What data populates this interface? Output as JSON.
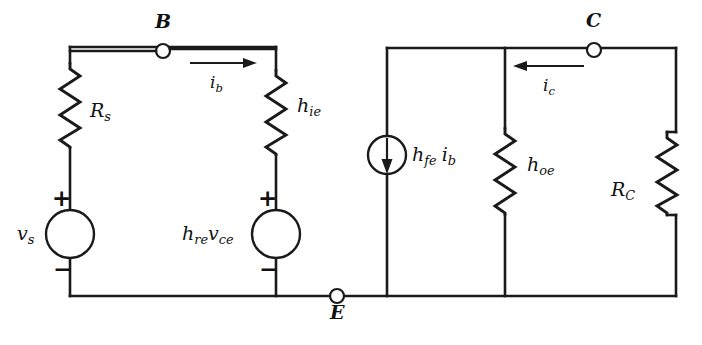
{
  "figure": {
    "type": "circuit-diagram",
    "background_color": "#ffffff",
    "line_color": "#1a1a1a",
    "width": 702,
    "height": 345
  },
  "nodes": [
    {
      "id": "B",
      "label": "B",
      "x": 163,
      "y": 51,
      "label_x": 155,
      "label_y": 15
    },
    {
      "id": "E",
      "label": "E",
      "x": 337,
      "y": 296,
      "label_x": 330,
      "label_y": 305
    },
    {
      "id": "C",
      "label": "C",
      "x": 594,
      "y": 50,
      "label_x": 586,
      "label_y": 14
    }
  ],
  "resistors": [
    {
      "id": "Rs",
      "base": "R",
      "sub": "s",
      "label": "R_s",
      "x": 70,
      "y_top": 63,
      "y_bottom": 148,
      "label_x": 90,
      "label_y": 100
    },
    {
      "id": "hie",
      "base": "h",
      "sub": "ie",
      "label": "h_ie",
      "x": 276,
      "y_top": 70,
      "y_bottom": 155,
      "label_x": 296,
      "label_y": 104
    },
    {
      "id": "hoe",
      "base": "h",
      "sub": "oe",
      "label": "h_oe",
      "x": 505,
      "y_top": 128,
      "y_bottom": 215,
      "label_x": 526,
      "label_y": 163
    },
    {
      "id": "Rc",
      "base": "R",
      "sub": "C",
      "label": "R_C",
      "x": 667,
      "y_top": 132,
      "y_bottom": 215,
      "label_x": 612,
      "label_y": 188
    }
  ],
  "voltage_sources": [
    {
      "id": "vs",
      "base": "v",
      "sub": "s",
      "label": "v_s",
      "cx": 70,
      "cy": 234,
      "r": 24,
      "label_x": 20,
      "label_y": 226,
      "plus": "+",
      "minus": "−",
      "plus_x": 57,
      "plus_y": 188,
      "minus_x": 59,
      "minus_y": 262
    },
    {
      "id": "hre_vce",
      "label": "h_re v_ce",
      "cx": 276,
      "cy": 234,
      "r": 24,
      "label_x": 186,
      "label_y": 226,
      "plus": "+",
      "minus": "−",
      "plus_x": 263,
      "plus_y": 188,
      "minus_x": 265,
      "minus_y": 262
    }
  ],
  "current_sources": [
    {
      "id": "hfe_ib",
      "label": "h_fe i_b",
      "cx": 387,
      "cy": 155,
      "r": 19,
      "arrow_direction": "down",
      "label_x": 412,
      "label_y": 147
    }
  ],
  "current_arrows": [
    {
      "id": "ib",
      "label": "i_b",
      "base": "i",
      "sub": "b",
      "direction": "right",
      "x_start": 190,
      "x_end": 256,
      "y": 63,
      "label_x": 210,
      "label_y": 76
    },
    {
      "id": "ic",
      "label": "i_c",
      "base": "i",
      "sub": "c",
      "direction": "left",
      "x_start": 584,
      "x_end": 514,
      "y": 66,
      "label_x": 543,
      "label_y": 79
    }
  ],
  "labels": {
    "node_b": "B",
    "node_e": "E",
    "node_c": "C",
    "rs_base": "R",
    "rs_sub": "s",
    "hie_base": "h",
    "hie_sub": "ie",
    "hoe_base": "h",
    "hoe_sub": "oe",
    "rc_base": "R",
    "rc_sub": "C",
    "vs_base": "v",
    "vs_sub": "s",
    "hre_base": "h",
    "hre_sub": "re",
    "vce_base": "v",
    "vce_sub": "ce",
    "hfe_base": "h",
    "hfe_sub": "fe",
    "ib_base": "i",
    "ib_sub": "b",
    "ic_base": "i",
    "ic_sub": "c",
    "plus_sign": "+",
    "minus_sign": "−"
  }
}
